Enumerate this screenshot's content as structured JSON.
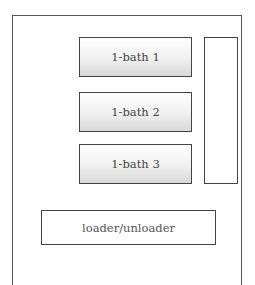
{
  "diagram": {
    "baths": [
      {
        "label": "1-bath 1"
      },
      {
        "label": "1-bath 2"
      },
      {
        "label": "1-bath 3"
      }
    ],
    "side_panel": {
      "label": ""
    },
    "loader": {
      "label": "loader/unloader"
    }
  }
}
